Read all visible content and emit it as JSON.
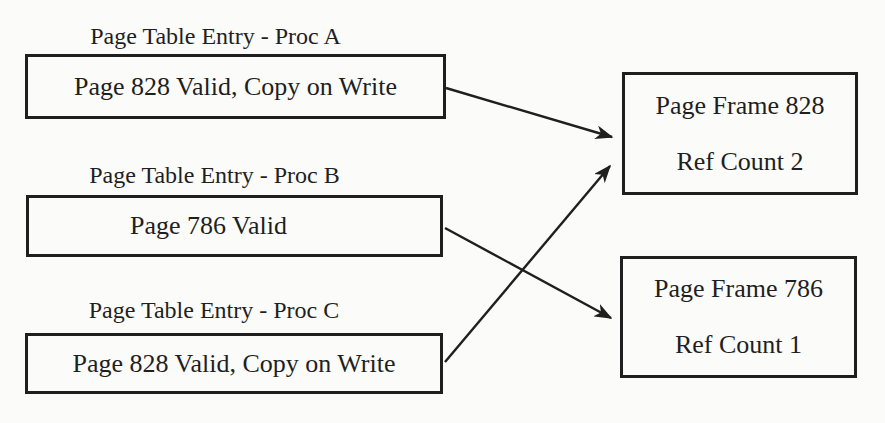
{
  "colors": {
    "ink": "#1f1f1f",
    "background": "#fbfbf9"
  },
  "page_table_entries": [
    {
      "id": "proc-a",
      "label": "Page Table Entry - Proc A",
      "content": "Page 828 Valid, Copy on Write"
    },
    {
      "id": "proc-b",
      "label": "Page Table Entry - Proc B",
      "content": "Page 786 Valid"
    },
    {
      "id": "proc-c",
      "label": "Page Table Entry - Proc C",
      "content": "Page 828 Valid, Copy on Write"
    }
  ],
  "page_frames": [
    {
      "id": "frame-828",
      "title": "Page Frame 828",
      "ref_count": "Ref Count 2"
    },
    {
      "id": "frame-786",
      "title": "Page Frame 786",
      "ref_count": "Ref Count 1"
    }
  ],
  "arrows": [
    {
      "from": "pte-proc-a",
      "to": "page-frame-828",
      "x1": 446,
      "y1": 88,
      "x2": 612,
      "y2": 137
    },
    {
      "from": "pte-proc-b",
      "to": "page-frame-786",
      "x1": 445,
      "y1": 228,
      "x2": 611,
      "y2": 318
    },
    {
      "from": "pte-proc-c",
      "to": "page-frame-828",
      "x1": 445,
      "y1": 362,
      "x2": 610,
      "y2": 166
    }
  ]
}
